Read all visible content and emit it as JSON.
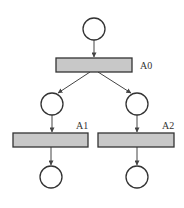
{
  "diagram": {
    "type": "petri-net",
    "places": [
      {
        "id": "p0",
        "cx": 94,
        "cy": 29,
        "r": 11
      },
      {
        "id": "p1",
        "cx": 52,
        "cy": 104,
        "r": 11
      },
      {
        "id": "p2",
        "cx": 137,
        "cy": 104,
        "r": 11
      },
      {
        "id": "p3",
        "cx": 51,
        "cy": 177,
        "r": 11
      },
      {
        "id": "p4",
        "cx": 137,
        "cy": 177,
        "r": 11
      }
    ],
    "transitions": [
      {
        "id": "A0",
        "label": "A0",
        "x": 56,
        "y": 58,
        "w": 76,
        "h": 14,
        "label_x": 140,
        "label_y": 69
      },
      {
        "id": "A1",
        "label": "A1",
        "x": 13,
        "y": 133,
        "w": 75,
        "h": 14,
        "label_x": 76,
        "label_y": 129
      },
      {
        "id": "A2",
        "label": "A2",
        "x": 98,
        "y": 133,
        "w": 76,
        "h": 14,
        "label_x": 162,
        "label_y": 129
      }
    ],
    "arcs": [
      {
        "from": "p0",
        "to": "A0"
      },
      {
        "from": "A0",
        "to": "p1"
      },
      {
        "from": "A0",
        "to": "p2"
      },
      {
        "from": "p1",
        "to": "A1"
      },
      {
        "from": "p2",
        "to": "A2"
      },
      {
        "from": "A1",
        "to": "p3"
      },
      {
        "from": "A2",
        "to": "p4"
      }
    ],
    "colors": {
      "transition_fill": "#c8c8c8",
      "stroke": "#333333"
    }
  }
}
